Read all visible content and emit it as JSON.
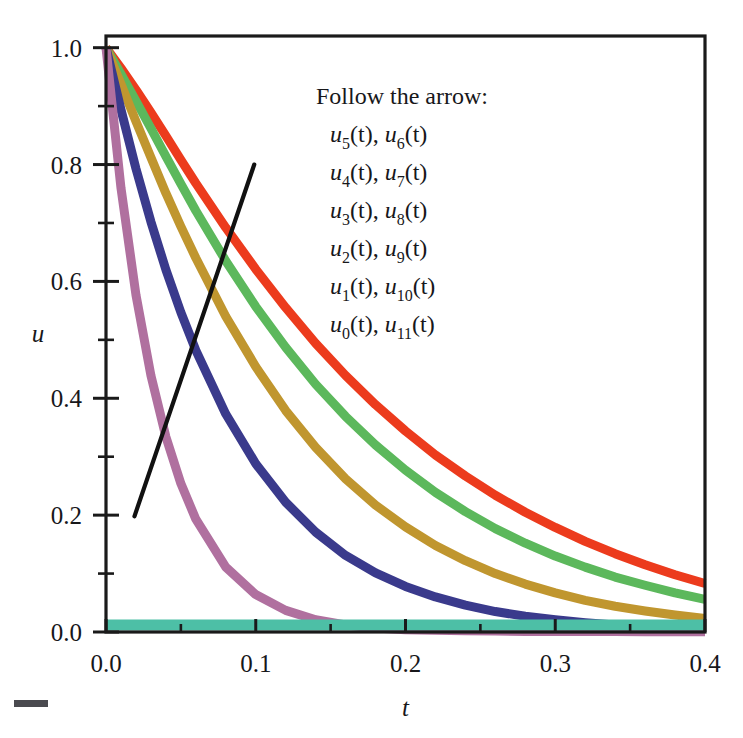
{
  "figure": {
    "background": "#ffffff",
    "frame_color": "#1a1a1a"
  },
  "axes": {
    "x_title": "t",
    "y_title": "u",
    "x_ticks": [
      "0.0",
      "0.1",
      "0.2",
      "0.3",
      "0.4"
    ],
    "y_ticks": [
      "0.0",
      "0.2",
      "0.4",
      "0.6",
      "0.8",
      "1.0"
    ],
    "x_minor_count": 1,
    "y_minor_count": 1
  },
  "legend": {
    "heading": "Follow the arrow:",
    "rows": [
      {
        "left_var": "u",
        "left_sub": "5",
        "right_var": "u",
        "right_sub": "6"
      },
      {
        "left_var": "u",
        "left_sub": "4",
        "right_var": "u",
        "right_sub": "7"
      },
      {
        "left_var": "u",
        "left_sub": "3",
        "right_var": "u",
        "right_sub": "8"
      },
      {
        "left_var": "u",
        "left_sub": "2",
        "right_var": "u",
        "right_sub": "9"
      },
      {
        "left_var": "u",
        "left_sub": "1",
        "right_var": "u",
        "right_sub": "10"
      },
      {
        "left_var": "u",
        "left_sub": "0",
        "right_var": "u",
        "right_sub": "11"
      }
    ],
    "arg": "(t)",
    "separator": ", "
  },
  "annotation": {
    "arrow_label": "direction-arrow",
    "arrow_color": "#111111",
    "arrow_from": [
      0.019,
      0.198
    ],
    "arrow_to": [
      0.099,
      0.8
    ]
  },
  "chart_data": {
    "type": "line",
    "title": "",
    "xlabel": "t",
    "ylabel": "u",
    "xlim": [
      0.0,
      0.4
    ],
    "ylim": [
      0.0,
      1.02
    ],
    "grid": false,
    "legend_position": "upper-center-inside",
    "x_tick_values": [
      0.0,
      0.1,
      0.2,
      0.3,
      0.4
    ],
    "y_tick_values": [
      0.0,
      0.2,
      0.4,
      0.6,
      0.8,
      1.0
    ],
    "x": [
      0.0,
      0.01,
      0.02,
      0.03,
      0.04,
      0.05,
      0.06,
      0.08,
      0.1,
      0.12,
      0.14,
      0.16,
      0.18,
      0.2,
      0.22,
      0.24,
      0.26,
      0.28,
      0.3,
      0.32,
      0.34,
      0.36,
      0.38,
      0.4
    ],
    "series": [
      {
        "name": "u5(t), u6(t)",
        "color": "#ec3b1d",
        "linewidth": 9,
        "values": [
          1.0,
          0.965,
          0.928,
          0.889,
          0.849,
          0.808,
          0.768,
          0.692,
          0.621,
          0.555,
          0.494,
          0.439,
          0.389,
          0.344,
          0.303,
          0.267,
          0.234,
          0.205,
          0.179,
          0.155,
          0.134,
          0.115,
          0.098,
          0.083
        ]
      },
      {
        "name": "u4(t), u7(t)",
        "color": "#5cb85c",
        "linewidth": 9,
        "values": [
          1.0,
          0.955,
          0.909,
          0.862,
          0.814,
          0.767,
          0.721,
          0.635,
          0.557,
          0.487,
          0.424,
          0.369,
          0.32,
          0.277,
          0.239,
          0.206,
          0.177,
          0.152,
          0.13,
          0.111,
          0.094,
          0.08,
          0.067,
          0.056
        ]
      },
      {
        "name": "u3(t), u8(t)",
        "color": "#c0962f",
        "linewidth": 9,
        "values": [
          1.0,
          0.938,
          0.874,
          0.812,
          0.751,
          0.694,
          0.64,
          0.54,
          0.454,
          0.379,
          0.316,
          0.262,
          0.217,
          0.18,
          0.148,
          0.122,
          0.1,
          0.082,
          0.067,
          0.054,
          0.044,
          0.036,
          0.029,
          0.023
        ]
      },
      {
        "name": "u2(t), u9(t)",
        "color": "#3a3a8c",
        "linewidth": 9,
        "values": [
          1.0,
          0.894,
          0.793,
          0.702,
          0.62,
          0.547,
          0.482,
          0.373,
          0.288,
          0.222,
          0.171,
          0.131,
          0.101,
          0.078,
          0.06,
          0.046,
          0.035,
          0.027,
          0.021,
          0.016,
          0.012,
          0.009,
          0.007,
          0.006
        ]
      },
      {
        "name": "u1(t), u10(t)",
        "color": "#b0709f",
        "linewidth": 9,
        "values": [
          1.0,
          0.76,
          0.577,
          0.439,
          0.334,
          0.254,
          0.193,
          0.111,
          0.064,
          0.037,
          0.021,
          0.012,
          0.007,
          0.004,
          0.003,
          0.002,
          0.0015,
          0.001,
          0.001,
          0.001,
          0.0008,
          0.0006,
          0.0005,
          0.0004
        ]
      },
      {
        "name": "u0(t), u11(t)",
        "color": "#4dbfa6",
        "linewidth": 11,
        "values": [
          0.012,
          0.012,
          0.012,
          0.012,
          0.012,
          0.012,
          0.012,
          0.012,
          0.012,
          0.012,
          0.012,
          0.012,
          0.012,
          0.012,
          0.012,
          0.012,
          0.012,
          0.012,
          0.012,
          0.012,
          0.012,
          0.012,
          0.012,
          0.012
        ]
      }
    ],
    "annotations": [
      {
        "type": "line",
        "text": "Follow the arrow:",
        "from": [
          0.019,
          0.198
        ],
        "to": [
          0.099,
          0.8
        ],
        "color": "#111111"
      }
    ]
  }
}
